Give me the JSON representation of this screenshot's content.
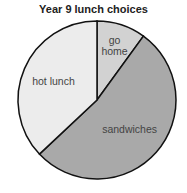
{
  "chart_data": {
    "type": "pie",
    "title": "Year 9 lunch choices",
    "slices": [
      {
        "label": "go home",
        "label_lines": [
          "go",
          "home"
        ],
        "value": 10,
        "color": "#d2d2d2"
      },
      {
        "label": "sandwiches",
        "label_lines": [
          "sandwiches"
        ],
        "value": 53,
        "color": "#a9a9a9"
      },
      {
        "label": "hot lunch",
        "label_lines": [
          "hot lunch"
        ],
        "value": 37,
        "color": "#ececec"
      }
    ],
    "unit": "percent",
    "start": "top",
    "direction": "clockwise",
    "legend": "none"
  }
}
